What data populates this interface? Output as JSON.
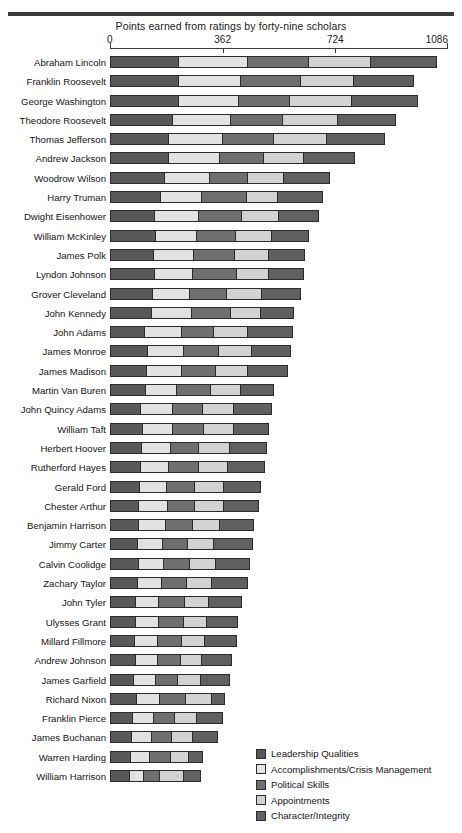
{
  "figure": {
    "title": "Points earned from ratings by forty-nine scholars"
  },
  "colors": {
    "leadership": "#595959",
    "accomplishments": "#e2e2e2",
    "political": "#6f6f6f",
    "appointments": "#d2d2d2",
    "character": "#606060",
    "rule": "#3c3c3c",
    "outline": "#2b2b2b"
  },
  "legend": {
    "position": "bottom-right",
    "items": [
      {
        "label": "Leadership Qualities",
        "swatch": "s0"
      },
      {
        "label": "Accomplishments/Crisis Management",
        "swatch": "s1"
      },
      {
        "label": "Political Skills",
        "swatch": "s2"
      },
      {
        "label": "Appointments",
        "swatch": "s3"
      },
      {
        "label": "Character/Integrity",
        "swatch": "s4"
      }
    ]
  },
  "chart_data": {
    "type": "bar",
    "orientation": "horizontal",
    "stacked": true,
    "title": "Points earned from ratings by forty-nine scholars",
    "xlabel": "",
    "ylabel": "",
    "xlim": [
      0,
      1086
    ],
    "xticks": [
      0,
      362,
      724,
      1086
    ],
    "xticklabels": [
      "0",
      "362",
      "724",
      "1086"
    ],
    "grid": false,
    "series": [
      {
        "name": "Leadership Qualities",
        "key": "s0"
      },
      {
        "name": "Accomplishments/Crisis Management",
        "key": "s1"
      },
      {
        "name": "Political Skills",
        "key": "s2"
      },
      {
        "name": "Appointments",
        "key": "s3"
      },
      {
        "name": "Character/Integrity",
        "key": "s4"
      }
    ],
    "categories": [
      "Abraham Lincoln",
      "Franklin Roosevelt",
      "George Washington",
      "Theodore Roosevelt",
      "Thomas Jefferson",
      "Andrew Jackson",
      "Woodrow Wilson",
      "Harry Truman",
      "Dwight Eisenhower",
      "William McKinley",
      "James Polk",
      "Lyndon Johnson",
      "Grover Cleveland",
      "John Kennedy",
      "John Adams",
      "James Monroe",
      "James Madison",
      "Martin Van Buren",
      "John Quincy Adams",
      "William Taft",
      "Herbert Hoover",
      "Rutherford Hayes",
      "Gerald Ford",
      "Chester Arthur",
      "Benjamin Harrison",
      "Jimmy Carter",
      "Calvin Coolidge",
      "Zachary Taylor",
      "John Tyler",
      "Ulysses Grant",
      "Millard Fillmore",
      "Andrew Johnson",
      "James Garfield",
      "Richard Nixon",
      "Franklin Pierce",
      "James Buchanan",
      "Warren Harding",
      "William Harrison"
    ],
    "rows": [
      {
        "label": "Abraham Lincoln",
        "values": [
          222,
          225,
          200,
          200,
          216
        ],
        "total": 1063
      },
      {
        "label": "Franklin Roosevelt",
        "values": [
          222,
          203,
          196,
          174,
          195
        ],
        "total": 990
      },
      {
        "label": "George Washington",
        "values": [
          222,
          196,
          167,
          203,
          215
        ],
        "total": 1003
      },
      {
        "label": "Theodore Roosevelt",
        "values": [
          203,
          190,
          170,
          180,
          190
        ],
        "total": 933
      },
      {
        "label": "Thomas Jefferson",
        "values": [
          190,
          177,
          167,
          174,
          190
        ],
        "total": 898
      },
      {
        "label": "Andrew Jackson",
        "values": [
          190,
          167,
          145,
          132,
          167
        ],
        "total": 801
      },
      {
        "label": "Woodrow Wilson",
        "values": [
          177,
          148,
          125,
          119,
          151
        ],
        "total": 720
      },
      {
        "label": "Harry Truman",
        "values": [
          164,
          135,
          148,
          103,
          148
        ],
        "total": 698
      },
      {
        "label": "Dwight Eisenhower",
        "values": [
          145,
          145,
          139,
          125,
          132
        ],
        "total": 686
      },
      {
        "label": "William McKinley",
        "values": [
          148,
          135,
          129,
          119,
          122
        ],
        "total": 653
      },
      {
        "label": "James Polk",
        "values": [
          142,
          132,
          135,
          113,
          119
        ],
        "total": 641
      },
      {
        "label": "Lyndon Johnson",
        "values": [
          145,
          126,
          142,
          106,
          116
        ],
        "total": 635
      },
      {
        "label": "Grover Cleveland",
        "values": [
          139,
          122,
          122,
          116,
          129
        ],
        "total": 628
      },
      {
        "label": "John Kennedy",
        "values": [
          135,
          132,
          129,
          100,
          109
        ],
        "total": 605
      },
      {
        "label": "John Adams",
        "values": [
          113,
          122,
          106,
          113,
          148
        ],
        "total": 602
      },
      {
        "label": "James Monroe",
        "values": [
          122,
          119,
          116,
          109,
          129
        ],
        "total": 595
      },
      {
        "label": "James Madison",
        "values": [
          119,
          116,
          113,
          106,
          132
        ],
        "total": 586
      },
      {
        "label": "Martin Van Buren",
        "values": [
          116,
          103,
          113,
          100,
          109
        ],
        "total": 541
      },
      {
        "label": "John Quincy Adams",
        "values": [
          100,
          106,
          100,
          103,
          125
        ],
        "total": 534
      },
      {
        "label": "William Taft",
        "values": [
          106,
          100,
          103,
          100,
          116
        ],
        "total": 525
      },
      {
        "label": "Herbert Hoover",
        "values": [
          103,
          97,
          94,
          100,
          125
        ],
        "total": 519
      },
      {
        "label": "Rutherford Hayes",
        "values": [
          100,
          94,
          97,
          97,
          122
        ],
        "total": 510
      },
      {
        "label": "Gerald Ford",
        "values": [
          97,
          90,
          94,
          94,
          122
        ],
        "total": 497
      },
      {
        "label": "Chester Arthur",
        "values": [
          94,
          94,
          90,
          97,
          116
        ],
        "total": 491
      },
      {
        "label": "Benjamin Harrison",
        "values": [
          94,
          90,
          90,
          90,
          113
        ],
        "total": 477
      },
      {
        "label": "Jimmy Carter",
        "values": [
          90,
          84,
          84,
          87,
          129
        ],
        "total": 474
      },
      {
        "label": "Calvin Coolidge",
        "values": [
          94,
          84,
          87,
          84,
          113
        ],
        "total": 462
      },
      {
        "label": "Zachary Taylor",
        "values": [
          90,
          81,
          84,
          84,
          116
        ],
        "total": 455
      },
      {
        "label": "John Tyler",
        "values": [
          84,
          78,
          84,
          81,
          109
        ],
        "total": 436
      },
      {
        "label": "Ulysses Grant",
        "values": [
          84,
          78,
          81,
          78,
          103
        ],
        "total": 424
      },
      {
        "label": "Millard Fillmore",
        "values": [
          81,
          75,
          81,
          78,
          106
        ],
        "total": 421
      },
      {
        "label": "Andrew Johnson",
        "values": [
          84,
          72,
          78,
          72,
          100
        ],
        "total": 406
      },
      {
        "label": "James Garfield",
        "values": [
          78,
          72,
          75,
          78,
          94
        ],
        "total": 397
      },
      {
        "label": "Richard Nixon",
        "values": [
          87,
          78,
          87,
          87,
          45
        ],
        "total": 384
      },
      {
        "label": "Franklin Pierce",
        "values": [
          75,
          69,
          72,
          72,
          87
        ],
        "total": 375
      },
      {
        "label": "James Buchanan",
        "values": [
          72,
          66,
          69,
          69,
          84
        ],
        "total": 360
      },
      {
        "label": "Warren Harding",
        "values": [
          69,
          63,
          69,
          63,
          48
        ],
        "total": 312
      },
      {
        "label": "William Harrison",
        "values": [
          63,
          48,
          57,
          78,
          60
        ],
        "total": 306
      }
    ]
  }
}
